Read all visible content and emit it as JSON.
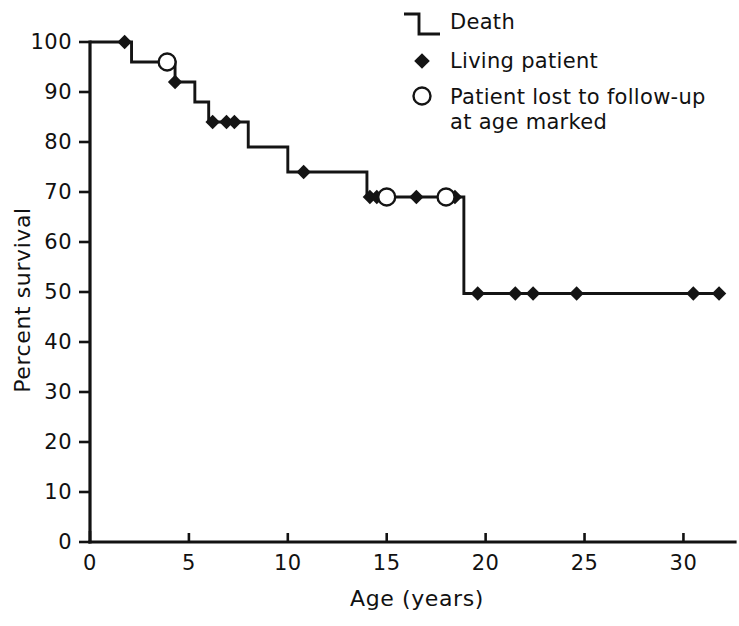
{
  "chart_data": {
    "type": "line",
    "subtype": "kaplan-meier-step",
    "title": "",
    "xlabel": "Age (years)",
    "ylabel": "Percent survival",
    "xlim": [
      0,
      32
    ],
    "ylim": [
      0,
      100
    ],
    "xticks": [
      0,
      5,
      10,
      15,
      20,
      25,
      30
    ],
    "xtick_labels": [
      "0",
      "5",
      "10",
      "15",
      "20",
      "25",
      "30"
    ],
    "yticks": [
      0,
      10,
      20,
      30,
      40,
      50,
      60,
      70,
      80,
      90,
      100
    ],
    "ytick_labels": [
      "0",
      "10",
      "20",
      "30",
      "40",
      "50",
      "60",
      "70",
      "80",
      "90",
      "100"
    ],
    "grid": false,
    "legend_position": "top-right",
    "series": [
      {
        "name": "Survival",
        "step_points": [
          {
            "x": 0.0,
            "y": 100
          },
          {
            "x": 2.1,
            "y": 100
          },
          {
            "x": 2.1,
            "y": 96
          },
          {
            "x": 4.3,
            "y": 96
          },
          {
            "x": 4.3,
            "y": 92
          },
          {
            "x": 5.3,
            "y": 92
          },
          {
            "x": 5.3,
            "y": 88
          },
          {
            "x": 6.0,
            "y": 88
          },
          {
            "x": 6.0,
            "y": 84
          },
          {
            "x": 8.0,
            "y": 84
          },
          {
            "x": 8.0,
            "y": 79
          },
          {
            "x": 10.0,
            "y": 79
          },
          {
            "x": 10.0,
            "y": 74
          },
          {
            "x": 14.0,
            "y": 74
          },
          {
            "x": 14.0,
            "y": 69
          },
          {
            "x": 18.9,
            "y": 69
          },
          {
            "x": 18.9,
            "y": 49.7
          },
          {
            "x": 32.0,
            "y": 49.7
          }
        ]
      }
    ],
    "markers": {
      "death_label": "Living patient",
      "censor_label": "Patient lost to follow-up at age marked",
      "living_patients": [
        {
          "x": 1.75,
          "y": 100
        },
        {
          "x": 4.3,
          "y": 92
        },
        {
          "x": 6.2,
          "y": 84
        },
        {
          "x": 6.9,
          "y": 84
        },
        {
          "x": 7.3,
          "y": 84
        },
        {
          "x": 10.8,
          "y": 74
        },
        {
          "x": 14.15,
          "y": 69
        },
        {
          "x": 14.5,
          "y": 69
        },
        {
          "x": 16.5,
          "y": 69
        },
        {
          "x": 18.45,
          "y": 69
        },
        {
          "x": 19.6,
          "y": 49.7
        },
        {
          "x": 21.5,
          "y": 49.7
        },
        {
          "x": 22.4,
          "y": 49.7
        },
        {
          "x": 24.6,
          "y": 49.7
        },
        {
          "x": 30.5,
          "y": 49.7
        },
        {
          "x": 31.8,
          "y": 49.7
        }
      ],
      "lost_to_followup": [
        {
          "x": 3.9,
          "y": 96
        },
        {
          "x": 15.0,
          "y": 69
        },
        {
          "x": 18.0,
          "y": 69
        }
      ]
    },
    "colors": {
      "line": "#141414",
      "axis": "#121212",
      "text": "#111111",
      "marker_fill": "#141414",
      "censor_fill": "#ffffff",
      "background": "#ffffff"
    }
  },
  "legend": {
    "items": [
      {
        "symbol": "step-line",
        "label": "Death"
      },
      {
        "symbol": "filled-diamond",
        "label": "Living patient"
      },
      {
        "symbol": "open-circle",
        "label": "Patient lost to follow-up"
      },
      {
        "symbol": "none",
        "label": "at age marked"
      }
    ]
  },
  "axes": {
    "x_title": "Age (years)",
    "y_title": "Percent survival"
  }
}
